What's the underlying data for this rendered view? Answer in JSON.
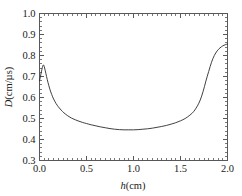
{
  "chart_data": {
    "type": "line",
    "title": "",
    "xlabel": "h(cm)",
    "ylabel": "D(cm/µs)",
    "xlabel_italic_part": "h",
    "xlabel_rest": "(cm)",
    "ylabel_italic_part": "D",
    "ylabel_rest": "(cm/µs)",
    "xlim": [
      0.0,
      2.0
    ],
    "ylim": [
      0.3,
      1.0
    ],
    "grid": false,
    "legend": null,
    "x_major_ticks": [
      0.0,
      0.5,
      1.0,
      1.5,
      2.0
    ],
    "x_tick_labels": [
      "0.0",
      "0.5",
      "1.0",
      "1.5",
      "2.0"
    ],
    "y_major_ticks": [
      0.3,
      0.4,
      0.5,
      0.6,
      0.7,
      0.8,
      0.9,
      1.0
    ],
    "y_tick_labels": [
      "0.3",
      "0.4",
      "0.5",
      "0.6",
      "0.7",
      "0.8",
      "0.9",
      "1.0"
    ],
    "x_minor_interval": 0.05,
    "y_minor_interval": 0.02,
    "tick_direction": "in",
    "line_color": "#2b2b2b",
    "frame_color": "#58585a",
    "series": [
      {
        "name": "D",
        "x": [
          0.0,
          0.01,
          0.02,
          0.03,
          0.04,
          0.05,
          0.06,
          0.075,
          0.09,
          0.11,
          0.13,
          0.15,
          0.175,
          0.2,
          0.23,
          0.26,
          0.3,
          0.34,
          0.38,
          0.42,
          0.46,
          0.5,
          0.55,
          0.6,
          0.65,
          0.7,
          0.75,
          0.8,
          0.85,
          0.9,
          0.95,
          1.0,
          1.05,
          1.1,
          1.15,
          1.2,
          1.25,
          1.3,
          1.35,
          1.4,
          1.45,
          1.5,
          1.55,
          1.6,
          1.64,
          1.68,
          1.71,
          1.74,
          1.77,
          1.8,
          1.83,
          1.86,
          1.89,
          1.92,
          1.95,
          1.975,
          2.0
        ],
        "y": [
          0.68,
          0.7,
          0.722,
          0.742,
          0.755,
          0.748,
          0.73,
          0.7,
          0.672,
          0.64,
          0.614,
          0.593,
          0.572,
          0.556,
          0.54,
          0.527,
          0.513,
          0.502,
          0.494,
          0.487,
          0.481,
          0.476,
          0.47,
          0.465,
          0.46,
          0.456,
          0.452,
          0.449,
          0.447,
          0.446,
          0.446,
          0.446,
          0.447,
          0.449,
          0.451,
          0.454,
          0.458,
          0.462,
          0.467,
          0.473,
          0.48,
          0.489,
          0.5,
          0.516,
          0.533,
          0.56,
          0.588,
          0.628,
          0.678,
          0.724,
          0.768,
          0.8,
          0.822,
          0.836,
          0.846,
          0.851,
          0.855
        ]
      }
    ]
  }
}
